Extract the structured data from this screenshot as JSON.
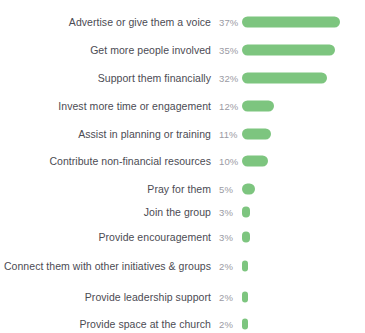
{
  "chart_data": {
    "type": "bar",
    "orientation": "horizontal",
    "title": "",
    "subtitle": "",
    "xlabel": "",
    "ylabel": "",
    "xlim": [
      0,
      37
    ],
    "grid": false,
    "legend": false,
    "value_suffix": "%",
    "bar_color": "#7dc57f",
    "label_color": "#4b4b53",
    "value_color": "#9b9ba3",
    "background": "#ffffff",
    "categories": [
      "Advertise or give them a voice",
      "Get more people involved",
      "Support them financially",
      "Invest more time or engagement",
      "Assist in planning or training",
      "Contribute non-financial resources",
      "Pray for them",
      "Join the group",
      "Provide encouragement",
      "Connect them with other initiatives & groups",
      "Provide leadership support",
      "Provide space at the church"
    ],
    "values": [
      37,
      35,
      32,
      12,
      11,
      10,
      5,
      3,
      3,
      2,
      2,
      2
    ],
    "value_labels": [
      "37%",
      "35%",
      "32%",
      "12%",
      "11%",
      "10%",
      "5%",
      "3%",
      "3%",
      "2%",
      "2%",
      "2%"
    ]
  }
}
